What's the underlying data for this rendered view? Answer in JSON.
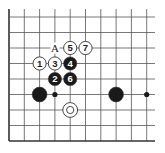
{
  "diagram": {
    "type": "go-board-fragment",
    "colors": {
      "line": "#555555",
      "edge": "#333333",
      "black_stone": "#1a1a1a",
      "white_stone": "#ffffff",
      "stone_outline": "#333333",
      "background": "#ffffff"
    },
    "grid": {
      "origin_x": 9,
      "origin_y": 17,
      "spacing_x": 15.3,
      "spacing_y": 15.5,
      "cols": 10,
      "rows": 9,
      "right_extent": 155,
      "top_extent": 9,
      "left_edge": true,
      "bottom_edge": true
    },
    "stones": [
      {
        "color": "white",
        "col": 4,
        "row": 2,
        "label": "5"
      },
      {
        "color": "white",
        "col": 5,
        "row": 2,
        "label": "7"
      },
      {
        "color": "white",
        "col": 2,
        "row": 3,
        "label": "1"
      },
      {
        "color": "white",
        "col": 3,
        "row": 3,
        "label": "3"
      },
      {
        "color": "black",
        "col": 4,
        "row": 3,
        "label": "4"
      },
      {
        "color": "black",
        "col": 3,
        "row": 4,
        "label": "2"
      },
      {
        "color": "black",
        "col": 4,
        "row": 4,
        "label": "6"
      },
      {
        "color": "black",
        "col": 2,
        "row": 5,
        "label": ""
      },
      {
        "color": "black",
        "col": 7,
        "row": 5,
        "label": ""
      },
      {
        "color": "white",
        "col": 4,
        "row": 6,
        "label": "",
        "marker": "circle"
      }
    ],
    "hoshi": [
      {
        "col": 3,
        "row": 5
      },
      {
        "col": 9,
        "row": 5
      }
    ],
    "point_labels": [
      {
        "col": 3,
        "row": 2,
        "text": "A"
      }
    ]
  }
}
